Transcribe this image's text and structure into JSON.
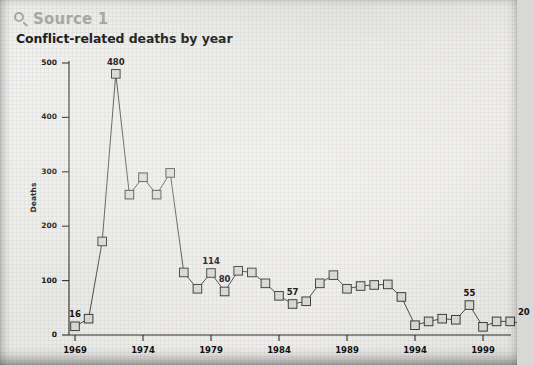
{
  "source": {
    "label": "Source 1",
    "icon": "magnifier-icon"
  },
  "chart_data": {
    "type": "line",
    "title": "Conflict-related deaths by year",
    "xlabel": "",
    "ylabel": "Deaths",
    "ylim": [
      0,
      500
    ],
    "yticks": [
      0,
      100,
      200,
      300,
      400,
      500
    ],
    "xticks": [
      1969,
      1974,
      1979,
      1984,
      1989,
      1994,
      1999
    ],
    "xlim": [
      1968.5,
      2002.5
    ],
    "grid": false,
    "legend": "none",
    "marker": "square",
    "x": [
      1969,
      1970,
      1971,
      1972,
      1973,
      1974,
      1975,
      1976,
      1977,
      1978,
      1979,
      1980,
      1981,
      1982,
      1983,
      1984,
      1985,
      1986,
      1987,
      1988,
      1989,
      1990,
      1991,
      1992,
      1993,
      1994,
      1995,
      1996,
      1997,
      1998,
      1999,
      2000,
      2001,
      2002
    ],
    "values": [
      16,
      30,
      172,
      480,
      258,
      290,
      258,
      298,
      115,
      85,
      114,
      80,
      118,
      115,
      95,
      72,
      57,
      62,
      95,
      110,
      85,
      90,
      92,
      93,
      70,
      18,
      25,
      30,
      28,
      55,
      15,
      25,
      25,
      20
    ],
    "point_labels": [
      {
        "x": 1969,
        "value": 16,
        "text": "16"
      },
      {
        "x": 1972,
        "value": 480,
        "text": "480"
      },
      {
        "x": 1979,
        "value": 114,
        "text": "114"
      },
      {
        "x": 1980,
        "value": 80,
        "text": "80"
      },
      {
        "x": 1985,
        "value": 57,
        "text": "57"
      },
      {
        "x": 1998,
        "value": 55,
        "text": "55"
      },
      {
        "x": 2002,
        "value": 20,
        "text": "20"
      }
    ],
    "colors": {
      "line": "#4a4a4a",
      "marker_fill": "#d6d6d2",
      "marker_edge": "#3c3c3c",
      "axis": "#2b2b2b",
      "text": "#111111"
    }
  }
}
